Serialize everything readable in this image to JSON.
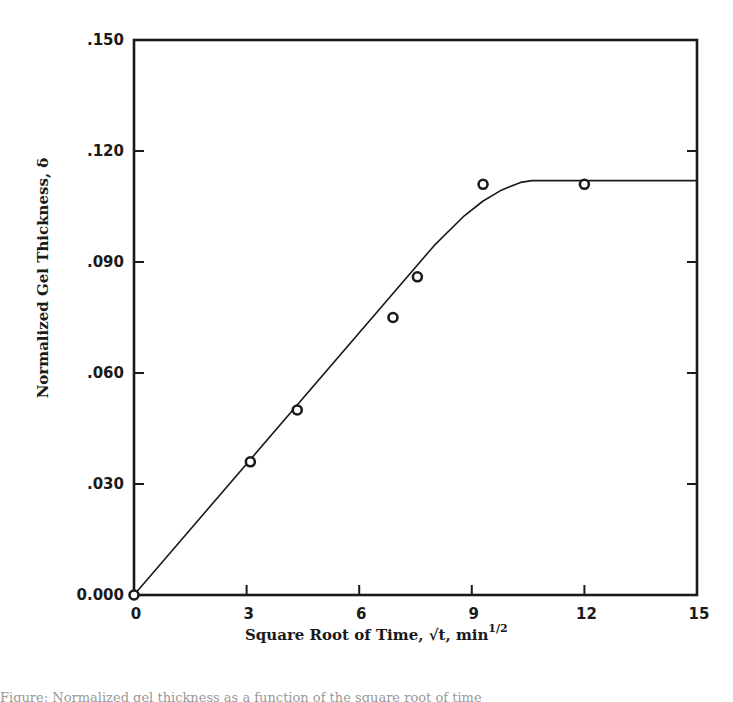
{
  "chart_data": {
    "type": "scatter",
    "title": "",
    "xlabel": "Square Root of Time, √t, min^1/2",
    "xlabel_main": "Square Root of Time, ",
    "xlabel_sqrt": "√t",
    "xlabel_unit": ", min",
    "xlabel_exp": "1/2",
    "ylabel": "Normalized Gel Thickness, δ",
    "xlim": [
      0,
      15
    ],
    "ylim": [
      0.0,
      0.15
    ],
    "x_ticks": [
      0,
      3,
      6,
      9,
      12,
      15
    ],
    "x_tick_labels": [
      "0",
      "3",
      "6",
      "9",
      "12",
      "15"
    ],
    "y_ticks": [
      0.0,
      0.03,
      0.06,
      0.09,
      0.12,
      0.15
    ],
    "y_tick_labels": [
      "0.000",
      ".030",
      ".060",
      ".090",
      ".120",
      ".150"
    ],
    "grid": false,
    "legend": null,
    "series": [
      {
        "name": "measured",
        "marker": "open-circle",
        "x": [
          0,
          3.1,
          4.35,
          6.9,
          7.55,
          9.3,
          12.0
        ],
        "y": [
          0.0,
          0.036,
          0.05,
          0.075,
          0.086,
          0.111,
          0.111
        ]
      },
      {
        "name": "fit",
        "style": "line",
        "x": [
          0,
          8.0,
          8.8,
          9.3,
          9.8,
          10.3,
          10.6,
          15.0
        ],
        "y": [
          0.0,
          0.0945,
          0.1025,
          0.1065,
          0.1095,
          0.1115,
          0.112,
          0.112
        ]
      }
    ]
  },
  "caption": "Figure: Normalized gel thickness as a function of the square root of time"
}
